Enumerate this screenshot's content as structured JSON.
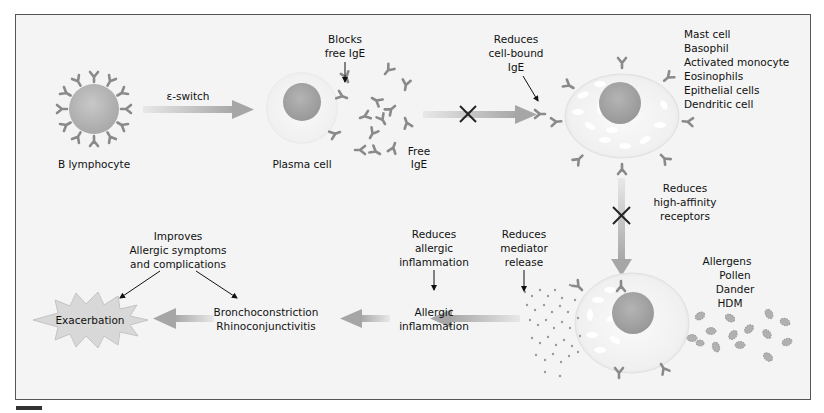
{
  "diagram": {
    "nodes": {
      "b_lymphocyte": "B lymphocyte",
      "plasma_cell": "Plasma cell",
      "free_ige": [
        "Free",
        "IgE"
      ],
      "target_cells": [
        "Mast cell",
        "Basophil",
        "Activated monocyte",
        "Eosinophils",
        "Epithelial cells",
        "Dendritic cell"
      ],
      "allergens": [
        "Allergens",
        "Pollen",
        "Dander",
        "HDM"
      ],
      "allergic_inflammation": [
        "Allergic",
        "inflammation"
      ],
      "symptoms": [
        "Bronchoconstriction",
        "Rhinoconjunctivitis"
      ],
      "exacerbation": "Exacerbation"
    },
    "edges": {
      "e_switch": "ε-switch"
    },
    "annotations": {
      "blocks_free_ige": [
        "Blocks",
        "free IgE"
      ],
      "reduces_cell_bound": [
        "Reduces",
        "cell-bound",
        "IgE"
      ],
      "reduces_receptors": [
        "Reduces",
        "high-affinity",
        "receptors"
      ],
      "reduces_mediator": [
        "Reduces",
        "mediator",
        "release"
      ],
      "reduces_inflammation": [
        "Reduces",
        "allergic",
        "inflammation"
      ],
      "improves": [
        "Improves",
        "Allergic symptoms",
        "and complications"
      ]
    },
    "colors": {
      "background": "#f4f4f4",
      "border": "#555555",
      "arrow": "#a8a8a8",
      "cell_fill": "#eeeeee",
      "nucleus": "#a0a0a0",
      "antibody": "#8a8a8a",
      "text": "#111111"
    }
  }
}
